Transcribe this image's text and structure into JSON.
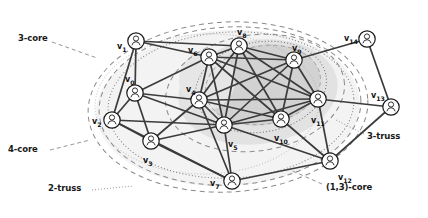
{
  "figure": {
    "type": "graph-diagram",
    "background_color": "#ffffff",
    "node_stroke": "#1a1a1a",
    "edge_color": "#3b3b3b",
    "boundary_color": "#808080",
    "shade_outer": "#ececec",
    "shade_mid": "#dcdcdc",
    "shade_inner": "#cccccc"
  },
  "nodes": [
    {
      "id": "v0",
      "label": "v",
      "sub": "0",
      "x": 135,
      "y": 93,
      "label_x": 125,
      "label_y": 75,
      "icon": "person-icon"
    },
    {
      "id": "v1",
      "label": "v",
      "sub": "1",
      "x": 136,
      "y": 41,
      "label_x": 117,
      "label_y": 42,
      "icon": "person-icon"
    },
    {
      "id": "v2",
      "label": "v",
      "sub": "2",
      "x": 112,
      "y": 120,
      "label_x": 92,
      "label_y": 117,
      "icon": "person-icon"
    },
    {
      "id": "v3",
      "label": "v",
      "sub": "3",
      "x": 151,
      "y": 141,
      "label_x": 143,
      "label_y": 156,
      "icon": "person-icon"
    },
    {
      "id": "v4",
      "label": "v",
      "sub": "4",
      "x": 199,
      "y": 100,
      "label_x": 186,
      "label_y": 85,
      "icon": "person-icon"
    },
    {
      "id": "v5",
      "label": "v",
      "sub": "5",
      "x": 224,
      "y": 125,
      "label_x": 228,
      "label_y": 140,
      "icon": "person-icon"
    },
    {
      "id": "v6",
      "label": "v",
      "sub": "6",
      "x": 209,
      "y": 57,
      "label_x": 188,
      "label_y": 46,
      "icon": "person-icon"
    },
    {
      "id": "v7",
      "label": "v",
      "sub": "7",
      "x": 232,
      "y": 181,
      "label_x": 210,
      "label_y": 179,
      "icon": "person-icon"
    },
    {
      "id": "v8",
      "label": "v",
      "sub": "8",
      "x": 239,
      "y": 46,
      "label_x": 237,
      "label_y": 28,
      "icon": "person-icon"
    },
    {
      "id": "v9",
      "label": "v",
      "sub": "9",
      "x": 294,
      "y": 60,
      "label_x": 292,
      "label_y": 44,
      "icon": "person-icon"
    },
    {
      "id": "v10",
      "label": "v",
      "sub": "10",
      "x": 281,
      "y": 119,
      "label_x": 274,
      "label_y": 134,
      "icon": "person-icon"
    },
    {
      "id": "v11",
      "label": "v",
      "sub": "11",
      "x": 318,
      "y": 99,
      "label_x": 311,
      "label_y": 116,
      "icon": "person-icon"
    },
    {
      "id": "v12",
      "label": "v",
      "sub": "12",
      "x": 330,
      "y": 161,
      "label_x": 338,
      "label_y": 173,
      "icon": "person-icon"
    },
    {
      "id": "v13",
      "label": "v",
      "sub": "13",
      "x": 391,
      "y": 107,
      "label_x": 371,
      "label_y": 91,
      "icon": "person-icon"
    },
    {
      "id": "v14",
      "label": "v",
      "sub": "14",
      "x": 367,
      "y": 39,
      "label_x": 344,
      "label_y": 34,
      "icon": "person-icon"
    }
  ],
  "edges": [
    [
      "v1",
      "v0"
    ],
    [
      "v1",
      "v2"
    ],
    [
      "v1",
      "v6"
    ],
    [
      "v1",
      "v8"
    ],
    [
      "v0",
      "v2"
    ],
    [
      "v0",
      "v3"
    ],
    [
      "v0",
      "v4"
    ],
    [
      "v0",
      "v6"
    ],
    [
      "v0",
      "v5"
    ],
    [
      "v2",
      "v3"
    ],
    [
      "v2",
      "v5"
    ],
    [
      "v2",
      "v7"
    ],
    [
      "v3",
      "v4"
    ],
    [
      "v3",
      "v5"
    ],
    [
      "v3",
      "v7"
    ],
    [
      "v4",
      "v6"
    ],
    [
      "v4",
      "v8"
    ],
    [
      "v4",
      "v5"
    ],
    [
      "v4",
      "v9"
    ],
    [
      "v4",
      "v10"
    ],
    [
      "v4",
      "v11"
    ],
    [
      "v4",
      "v7"
    ],
    [
      "v6",
      "v8"
    ],
    [
      "v6",
      "v5"
    ],
    [
      "v6",
      "v9"
    ],
    [
      "v6",
      "v10"
    ],
    [
      "v6",
      "v11"
    ],
    [
      "v8",
      "v9"
    ],
    [
      "v8",
      "v5"
    ],
    [
      "v8",
      "v10"
    ],
    [
      "v8",
      "v11"
    ],
    [
      "v9",
      "v5"
    ],
    [
      "v9",
      "v10"
    ],
    [
      "v9",
      "v11"
    ],
    [
      "v9",
      "v14"
    ],
    [
      "v5",
      "v10"
    ],
    [
      "v5",
      "v11"
    ],
    [
      "v5",
      "v7"
    ],
    [
      "v5",
      "v12"
    ],
    [
      "v10",
      "v11"
    ],
    [
      "v10",
      "v12"
    ],
    [
      "v11",
      "v12"
    ],
    [
      "v11",
      "v13"
    ],
    [
      "v7",
      "v12"
    ],
    [
      "v12",
      "v13"
    ],
    [
      "v14",
      "v13"
    ]
  ],
  "regions": [
    {
      "name": "3-core",
      "label": "3-core",
      "label_x": 18,
      "label_y": 39,
      "style": "dashed"
    },
    {
      "name": "4-core",
      "label": "4-core",
      "label_x": 8,
      "label_y": 149,
      "style": "dashed"
    },
    {
      "name": "2-truss",
      "label": "2-truss",
      "label_x": 48,
      "label_y": 188,
      "style": "dotted"
    },
    {
      "name": "3-truss",
      "label": "3-truss",
      "label_x": 367,
      "label_y": 137,
      "style": "dotted"
    },
    {
      "name": "one-three-core",
      "label": "(1,3)-core",
      "label_x": 326,
      "label_y": 188,
      "style": "dashed"
    }
  ],
  "leaders": [
    {
      "from_name": "3-core-leader",
      "x1": 52,
      "y1": 42,
      "x2": 96,
      "y2": 57
    },
    {
      "from_name": "4-core-leader",
      "x1": 48,
      "y1": 151,
      "x2": 88,
      "y2": 141
    },
    {
      "from_name": "2-truss-leader",
      "x1": 92,
      "y1": 190,
      "x2": 130,
      "y2": 188
    },
    {
      "from_name": "3-truss-leader",
      "x1": 364,
      "y1": 135,
      "x2": 338,
      "y2": 122
    },
    {
      "from_name": "one-three-core-leader",
      "x1": 322,
      "y1": 185,
      "x2": 286,
      "y2": 170
    }
  ]
}
